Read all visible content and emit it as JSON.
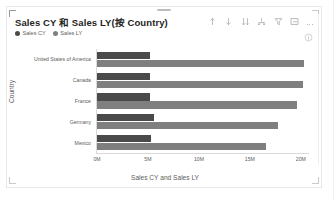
{
  "visual": {
    "title": "Sales CY 和 Sales LY(按 Country)",
    "legend": [
      {
        "label": "Sales CY",
        "color": "#4a4a4a"
      },
      {
        "label": "Sales LY",
        "color": "#7f7f7f"
      }
    ],
    "toolbar": [
      {
        "name": "sort-ascending-icon",
        "title": "升序排序"
      },
      {
        "name": "sort-descending-icon",
        "title": "降序排序"
      },
      {
        "name": "sort-bars-icon",
        "title": "排序依据"
      },
      {
        "name": "drill-hierarchy-icon",
        "title": "层次结构"
      },
      {
        "name": "filter-icon",
        "title": "筛选器"
      },
      {
        "name": "focus-mode-icon",
        "title": "焦点模式"
      },
      {
        "name": "more-options-icon",
        "title": "更多选项"
      }
    ],
    "info_icon": "info-icon"
  },
  "chart_data": {
    "type": "bar",
    "orientation": "horizontal",
    "title": "Sales CY 和 Sales LY(按 Country)",
    "xlabel": "Sales CY and Sales LY",
    "ylabel": "Country",
    "categories": [
      "United States of America",
      "Canada",
      "France",
      "Germany",
      "Mexico"
    ],
    "series": [
      {
        "name": "Sales CY",
        "color": "#4a4a4a",
        "values": [
          5200000,
          5200000,
          5200000,
          5600000,
          5300000
        ]
      },
      {
        "name": "Sales LY",
        "color": "#7f7f7f",
        "values": [
          20300000,
          20200000,
          19600000,
          17800000,
          16600000
        ]
      }
    ],
    "xlim": [
      0,
      20800000
    ],
    "xticks": [
      0,
      5000000,
      10000000,
      15000000,
      20000000
    ],
    "xtick_labels": [
      "0M",
      "5M",
      "10M",
      "15M",
      "20M"
    ],
    "grid": false,
    "legend_position": "top-left"
  }
}
